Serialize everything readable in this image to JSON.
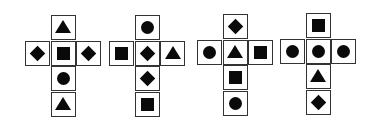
{
  "figures": [
    {
      "label": "figure-1",
      "origin": [
        25,
        15
      ],
      "cells": [
        {
          "pos": "top",
          "shape": "triangle"
        },
        {
          "pos": "left",
          "shape": "diamond"
        },
        {
          "pos": "center",
          "shape": "square"
        },
        {
          "pos": "right",
          "shape": "diamond"
        },
        {
          "pos": "below-1",
          "shape": "circle"
        },
        {
          "pos": "below-2",
          "shape": "triangle"
        }
      ]
    },
    {
      "label": "figure-2",
      "origin": [
        109,
        15
      ],
      "cells": [
        {
          "pos": "top",
          "shape": "circle"
        },
        {
          "pos": "left",
          "shape": "square"
        },
        {
          "pos": "center",
          "shape": "diamond"
        },
        {
          "pos": "right",
          "shape": "triangle"
        },
        {
          "pos": "below-1",
          "shape": "diamond"
        },
        {
          "pos": "below-2",
          "shape": "square"
        }
      ]
    },
    {
      "label": "figure-3",
      "origin": [
        197,
        14
      ],
      "cells": [
        {
          "pos": "top",
          "shape": "diamond"
        },
        {
          "pos": "left",
          "shape": "circle"
        },
        {
          "pos": "center",
          "shape": "triangle"
        },
        {
          "pos": "right",
          "shape": "square"
        },
        {
          "pos": "below-1",
          "shape": "square"
        },
        {
          "pos": "below-2",
          "shape": "circle"
        }
      ]
    },
    {
      "label": "figure-4",
      "origin": [
        280,
        13
      ],
      "cells": [
        {
          "pos": "top",
          "shape": "square"
        },
        {
          "pos": "left",
          "shape": "circle"
        },
        {
          "pos": "center",
          "shape": "circle"
        },
        {
          "pos": "right",
          "shape": "circle"
        },
        {
          "pos": "below-1",
          "shape": "triangle"
        },
        {
          "pos": "below-2",
          "shape": "diamond"
        }
      ]
    }
  ],
  "colors": {
    "shape_fill": "#0a0a0a",
    "border": "#333333",
    "background": "#ffffff"
  }
}
